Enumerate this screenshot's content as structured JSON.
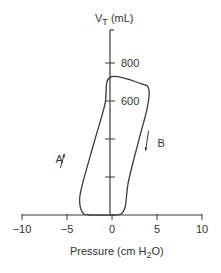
{
  "chart_data": {
    "type": "line",
    "title": "",
    "xlabel": "Pressure (cm H2O)",
    "xlabel_parts": {
      "pre": "Pressure (cm H",
      "sub": "2",
      "post": "O)"
    },
    "ylabel": "VT (mL)",
    "ylabel_parts": {
      "pre": "V",
      "sub": "T",
      "post": " (mL)"
    },
    "xlim": [
      -10,
      10
    ],
    "ylim": [
      0,
      1000
    ],
    "x_ticks": [
      -10,
      -5,
      0,
      5,
      10
    ],
    "x_tick_labels": [
      "−10",
      "−5",
      "0",
      "5",
      "10"
    ],
    "y_ticks": [
      200,
      400,
      600,
      800
    ],
    "y_tick_labels": [
      "",
      "",
      "600",
      "800"
    ],
    "grid": false,
    "legend": "none",
    "series": [
      {
        "name": "pressure-volume loop",
        "points": [
          {
            "x": 0,
            "y": 0
          },
          {
            "x": -2.5,
            "y": 0
          },
          {
            "x": -3.3,
            "y": 15
          },
          {
            "x": -3.6,
            "y": 80
          },
          {
            "x": -3.3,
            "y": 160
          },
          {
            "x": -2.0,
            "y": 380
          },
          {
            "x": -0.8,
            "y": 580
          },
          {
            "x": -0.2,
            "y": 726
          },
          {
            "x": 3.3,
            "y": 690
          },
          {
            "x": 4.1,
            "y": 660
          },
          {
            "x": 3.9,
            "y": 560
          },
          {
            "x": 2.9,
            "y": 380
          },
          {
            "x": 1.8,
            "y": 170
          },
          {
            "x": 1.5,
            "y": 50
          },
          {
            "x": 1.0,
            "y": 5
          },
          {
            "x": 0,
            "y": 0
          }
        ]
      }
    ],
    "annotations": [
      {
        "text": "A",
        "x": -5.4,
        "y": 285,
        "arrow": "up",
        "meaning": "inspiration"
      },
      {
        "text": "B",
        "x": 4.4,
        "y": 370,
        "arrow": "down",
        "meaning": "expiration"
      }
    ]
  }
}
